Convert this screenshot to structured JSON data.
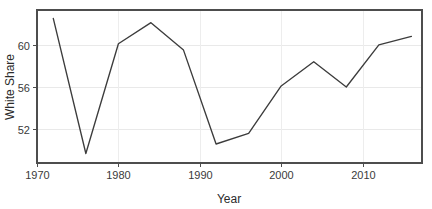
{
  "chart_data": {
    "type": "line",
    "title": "",
    "subtitle": "",
    "xlabel": "Year",
    "ylabel": "White Share",
    "x": [
      1972,
      1976,
      1980,
      1984,
      1988,
      1992,
      1996,
      2000,
      2004,
      2008,
      2012,
      2016
    ],
    "values": [
      62.5,
      49.7,
      60.1,
      62.1,
      59.5,
      50.6,
      51.6,
      56.1,
      58.4,
      56.0,
      60.0,
      60.8
    ],
    "series": [
      {
        "name": "White Share",
        "values": [
          62.5,
          49.7,
          60.1,
          62.1,
          59.5,
          50.6,
          51.6,
          56.1,
          58.4,
          56.0,
          60.0,
          60.8
        ]
      }
    ],
    "xlim": [
      1970.0,
      2017.3
    ],
    "ylim": [
      48.8,
      63.3
    ],
    "xticks": [
      1970,
      1980,
      1990,
      2000,
      2010
    ],
    "xtick_labels": [
      "1970",
      "1980",
      "1990",
      "2000",
      "2010"
    ],
    "yticks": [
      52,
      56,
      60
    ],
    "ytick_labels": [
      "52",
      "56",
      "60"
    ],
    "grid": true,
    "grid_axis": "both",
    "legend": false,
    "legend_position": "none",
    "line_color": "#3c3c3c",
    "grid_color": "#e9e9e9",
    "panel_border_color": "#4d4d4d",
    "background_color": "#ffffff",
    "annotations": []
  },
  "axes": {
    "x_label": "Year",
    "y_label": "White Share"
  }
}
